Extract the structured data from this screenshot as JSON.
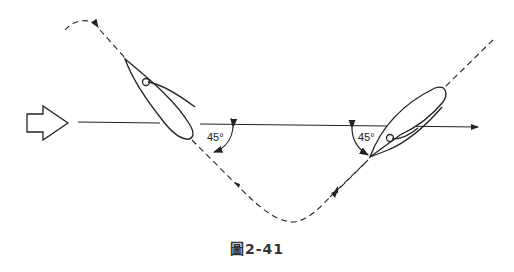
{
  "diagram": {
    "caption": "圖2-41",
    "angle_left": "45°",
    "angle_right": "45°",
    "colors": {
      "stroke": "#222222",
      "background": "#ffffff"
    },
    "elements": [
      {
        "type": "wind-arrow",
        "direction": "right"
      },
      {
        "type": "heading-line",
        "direction": "right"
      },
      {
        "type": "boat",
        "position": "left",
        "heading": "upper-left"
      },
      {
        "type": "boat",
        "position": "right",
        "heading": "upper-right"
      },
      {
        "type": "dashed-path",
        "shape": "V-shaped tack course with loops"
      }
    ]
  }
}
